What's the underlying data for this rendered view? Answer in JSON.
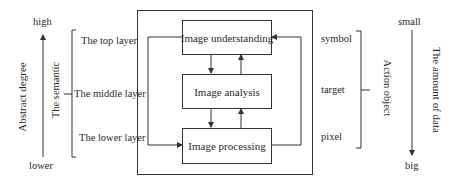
{
  "left_axis": {
    "top_label": "high",
    "bottom_label": "lower",
    "axis_title": "Abstract degree",
    "direction": "up"
  },
  "semantic": {
    "title": "The semantic",
    "layers": [
      {
        "label": "The top layer"
      },
      {
        "label": "The middle layer"
      },
      {
        "label": "The lower layer"
      }
    ]
  },
  "process": {
    "boxes": [
      {
        "label": "Image understanding"
      },
      {
        "label": "Image analysis"
      },
      {
        "label": "Image processing"
      }
    ]
  },
  "action_object": {
    "title": "Action object",
    "items": [
      {
        "label": "symbol"
      },
      {
        "label": "target"
      },
      {
        "label": "pixel"
      }
    ]
  },
  "right_axis": {
    "top_label": "small",
    "bottom_label": "big",
    "axis_title": "The amount of data",
    "direction": "down"
  }
}
